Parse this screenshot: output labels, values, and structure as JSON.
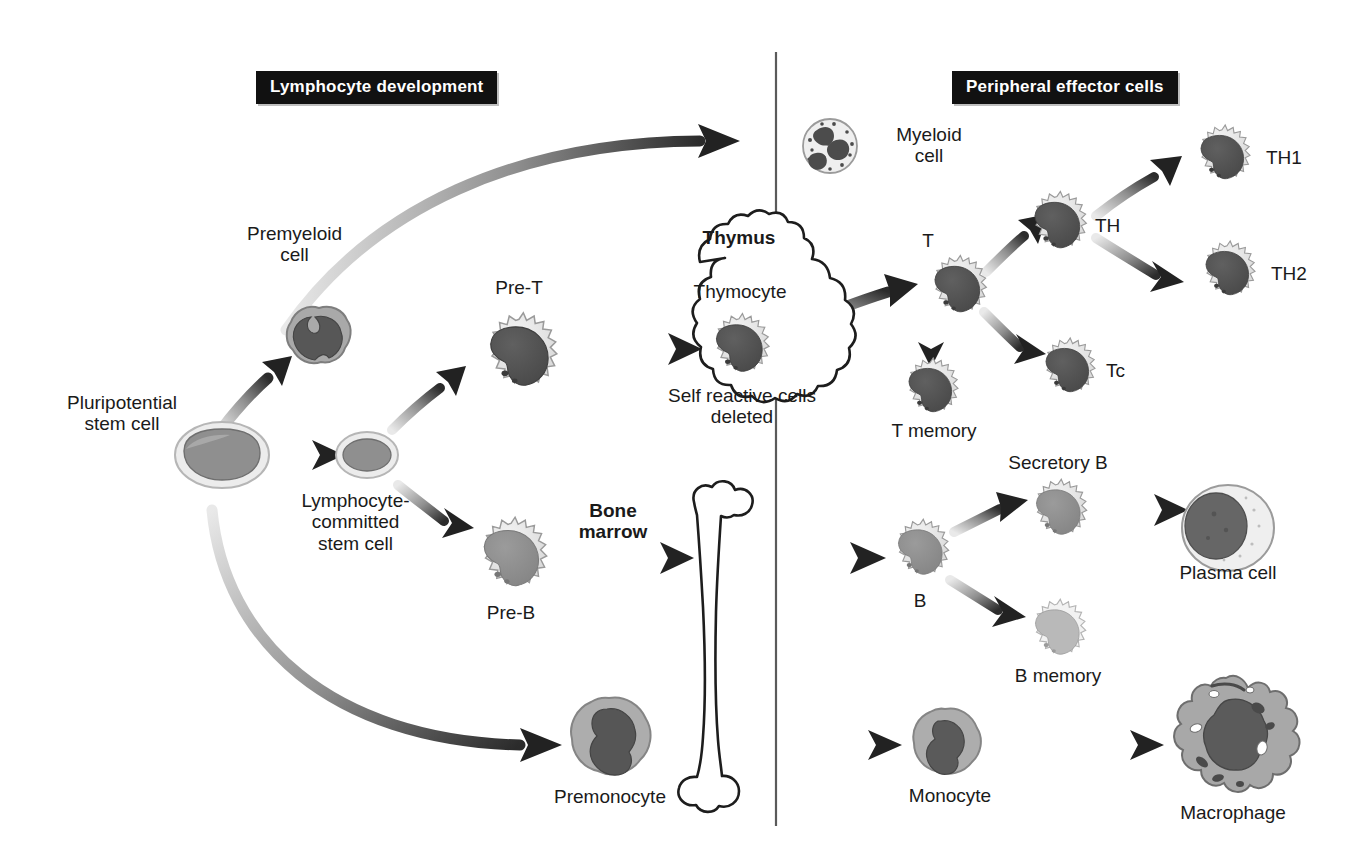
{
  "figure": {
    "type": "diagram"
  },
  "banners": {
    "left": "Lymphocyte development",
    "right": "Peripheral effector cells"
  },
  "labels": {
    "pluripotential_stem_cell": "Pluripotential\nstem cell",
    "premyeloid_cell": "Premyeloid\ncell",
    "lymphocyte_committed": "Lymphocyte-\ncommitted\nstem cell",
    "pre_t": "Pre-T",
    "pre_b": "Pre-B",
    "premonocyte": "Premonocyte",
    "bone_marrow": "Bone\nmarrow",
    "thymus": "Thymus",
    "thymocyte": "Thymocyte",
    "self_reactive": "Self reactive cells\ndeleted",
    "myeloid_cell": "Myeloid\ncell",
    "t_cell": "T",
    "t_memory": "T memory",
    "th": "TH",
    "th1": "TH1",
    "th2": "TH2",
    "tc": "Tc",
    "b_cell": "B",
    "secretory_b": "Secretory B",
    "b_memory": "B memory",
    "plasma_cell": "Plasma cell",
    "monocyte": "Monocyte",
    "macrophage": "Macrophage"
  },
  "nodes": [
    {
      "id": "pluripotential-stem-cell",
      "label": "Pluripotential stem cell",
      "x": 222,
      "y": 455,
      "kind": "oval-stem"
    },
    {
      "id": "premyeloid-cell",
      "label": "Premyeloid cell",
      "x": 319,
      "y": 340,
      "kind": "blob-dark"
    },
    {
      "id": "lymphocyte-committed-stem-cell",
      "label": "Lymphocyte-committed stem cell",
      "x": 367,
      "y": 455,
      "kind": "oval-stem-small"
    },
    {
      "id": "pre-t-cell",
      "label": "Pre-T",
      "x": 519,
      "y": 355,
      "kind": "spiky-dark"
    },
    {
      "id": "pre-b-cell",
      "label": "Pre-B",
      "x": 511,
      "y": 558,
      "kind": "spiky-mid"
    },
    {
      "id": "premonocyte",
      "label": "Premonocyte",
      "x": 609,
      "y": 742,
      "kind": "monocyte-large"
    },
    {
      "id": "thymocyte",
      "label": "Thymocyte",
      "x": 739,
      "y": 348,
      "kind": "spiky-dark-small"
    },
    {
      "id": "myeloid-cell",
      "label": "Myeloid cell",
      "x": 830,
      "y": 145,
      "kind": "granular"
    },
    {
      "id": "t-cell",
      "label": "T",
      "x": 957,
      "y": 288,
      "kind": "spiky-dark-small"
    },
    {
      "id": "t-memory-cell",
      "label": "T memory",
      "x": 922,
      "y": 385,
      "kind": "spiky-dark-small"
    },
    {
      "id": "th-cell",
      "label": "TH",
      "x": 1055,
      "y": 224,
      "kind": "spiky-dark-small"
    },
    {
      "id": "th1-cell",
      "label": "TH1",
      "x": 1223,
      "y": 157,
      "kind": "spiky-dark-small"
    },
    {
      "id": "th2-cell",
      "label": "TH2",
      "x": 1228,
      "y": 272,
      "kind": "spiky-dark-small"
    },
    {
      "id": "tc-cell",
      "label": "Tc",
      "x": 1066,
      "y": 369,
      "kind": "spiky-dark-small"
    },
    {
      "id": "b-cell",
      "label": "B",
      "x": 920,
      "y": 551,
      "kind": "spiky-mid-small"
    },
    {
      "id": "secretory-b-cell",
      "label": "Secretory B",
      "x": 1047,
      "y": 510,
      "kind": "spiky-mid-small"
    },
    {
      "id": "b-memory-cell",
      "label": "B memory",
      "x": 1053,
      "y": 630,
      "kind": "spiky-light-small"
    },
    {
      "id": "plasma-cell",
      "label": "Plasma cell",
      "x": 1228,
      "y": 527,
      "kind": "plasma"
    },
    {
      "id": "monocyte",
      "label": "Monocyte",
      "x": 945,
      "y": 745,
      "kind": "monocyte"
    },
    {
      "id": "macrophage",
      "label": "Macrophage",
      "x": 1232,
      "y": 741,
      "kind": "macrophage"
    }
  ],
  "edges": [
    {
      "from": "pluripotential-stem-cell",
      "to": "premyeloid-cell",
      "style": "straight"
    },
    {
      "from": "pluripotential-stem-cell",
      "to": "lymphocyte-committed-stem-cell",
      "style": "straight"
    },
    {
      "from": "pluripotential-stem-cell",
      "to": "myeloid-cell",
      "style": "curved"
    },
    {
      "from": "pluripotential-stem-cell",
      "to": "premonocyte",
      "style": "curved"
    },
    {
      "from": "lymphocyte-committed-stem-cell",
      "to": "pre-t-cell",
      "style": "straight"
    },
    {
      "from": "lymphocyte-committed-stem-cell",
      "to": "pre-b-cell",
      "style": "straight"
    },
    {
      "from": "pre-t-cell",
      "to": "thymocyte",
      "style": "straight"
    },
    {
      "from": "thymocyte",
      "to": "t-cell",
      "style": "straight"
    },
    {
      "from": "pre-b-cell",
      "to": "b-cell",
      "style": "straight"
    },
    {
      "from": "t-cell",
      "to": "th-cell",
      "style": "straight"
    },
    {
      "from": "t-cell",
      "to": "tc-cell",
      "style": "straight"
    },
    {
      "from": "t-cell",
      "to": "t-memory-cell",
      "style": "straight"
    },
    {
      "from": "th-cell",
      "to": "th1-cell",
      "style": "straight"
    },
    {
      "from": "th-cell",
      "to": "th2-cell",
      "style": "straight"
    },
    {
      "from": "b-cell",
      "to": "secretory-b-cell",
      "style": "straight"
    },
    {
      "from": "b-cell",
      "to": "b-memory-cell",
      "style": "straight"
    },
    {
      "from": "secretory-b-cell",
      "to": "plasma-cell",
      "style": "straight"
    },
    {
      "from": "premonocyte",
      "to": "monocyte",
      "style": "straight"
    },
    {
      "from": "monocyte",
      "to": "macrophage",
      "style": "straight"
    }
  ],
  "organs": [
    {
      "id": "thymus-cloud",
      "label": "Thymus"
    },
    {
      "id": "bone-marrow-bone",
      "label": "Bone marrow"
    }
  ],
  "colors": {
    "banner_bg": "#111111",
    "banner_text": "#ffffff",
    "text": "#1a1a1a",
    "arrow_dark": "#2b2b2b",
    "arrow_light": "#cfcfcf",
    "cytoplasm_light": "#e6e6e6",
    "cytoplasm_mid": "#a9a9a9",
    "nucleus_dark": "#555555",
    "nucleus_mid": "#8a8a8a",
    "divider": "#5a5a5a"
  },
  "divider": {
    "x": 776,
    "y1": 52,
    "y2": 826
  }
}
